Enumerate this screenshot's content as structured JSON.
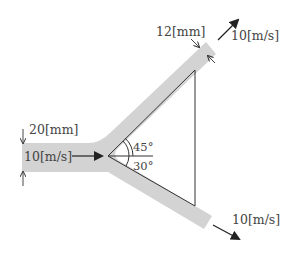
{
  "diagram": {
    "type": "Y-branch pipe flow",
    "colors": {
      "pipe_fill": "#d3d3d3",
      "line": "#333333",
      "arrow": "#222222",
      "text": "#444444"
    },
    "inlet": {
      "diameter_label": "20[mm]",
      "velocity_label": "10[m/s]"
    },
    "outlet_upper": {
      "diameter_label": "12[mm]",
      "velocity_label": "10[m/s]",
      "angle_label": "45°"
    },
    "outlet_lower": {
      "velocity_label": "10[m/s]",
      "angle_label": "30°"
    }
  }
}
